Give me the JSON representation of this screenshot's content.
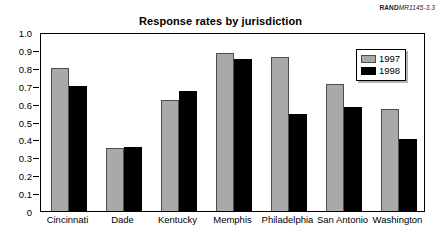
{
  "source_credit": {
    "org": "RAND",
    "document_id": "MR1145-3.3"
  },
  "chart_data": {
    "type": "bar",
    "title": "Response rates by jurisdiction",
    "xlabel": "",
    "ylabel": "",
    "ylim": [
      0,
      1.0
    ],
    "ytick_labels": [
      "1.0",
      "0.9",
      "0.8",
      "0.7",
      "0.6",
      "0.5",
      "0.4",
      "0.3",
      "0.2",
      "0.1",
      "0"
    ],
    "ytick_values": [
      1.0,
      0.9,
      0.8,
      0.7,
      0.6,
      0.5,
      0.4,
      0.3,
      0.2,
      0.1,
      0
    ],
    "grid": false,
    "legend_position": "top-right",
    "categories": [
      "Cincinnati",
      "Dade",
      "Kentucky",
      "Memphis",
      "Philadelphia",
      "San Antonio",
      "Washington"
    ],
    "series": [
      {
        "name": "1997",
        "color": "#a9a9a9",
        "values": [
          0.8,
          0.35,
          0.62,
          0.88,
          0.86,
          0.71,
          0.57
        ]
      },
      {
        "name": "1998",
        "color": "#000000",
        "values": [
          0.7,
          0.36,
          0.67,
          0.85,
          0.54,
          0.58,
          0.4
        ]
      }
    ]
  }
}
